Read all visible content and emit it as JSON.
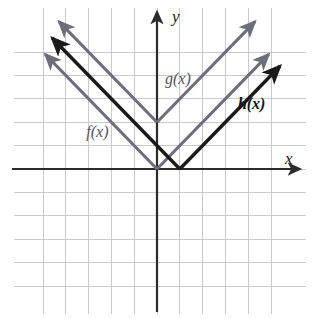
{
  "figure": {
    "type": "graph",
    "axis_labels": {
      "x": "x",
      "y": "y"
    },
    "curve_labels": {
      "f": "f(x)",
      "g": "g(x)",
      "h": "h(x)"
    }
  },
  "colors": {
    "grid": "#c9c9cf",
    "axis": "#2b2b2b",
    "gray_curve": "#6e6e78",
    "dark_curve": "#1a1a1a",
    "gray_label": "#55555f",
    "dark_label": "#141414",
    "background": "#ffffff"
  },
  "chart_data": {
    "type": "line",
    "title": "",
    "xlabel": "x",
    "ylabel": "y",
    "grid": true,
    "legend": "inline-annotations",
    "xlim": [
      -5,
      5
    ],
    "ylim": [
      -5,
      5
    ],
    "x_tick_step": 1,
    "y_tick_step": 1,
    "origin_px": {
      "x": 157,
      "y": 169
    },
    "unit_px": {
      "x": 22.8,
      "y": 23.4
    },
    "series": [
      {
        "name": "f(x)",
        "label": "f(x)",
        "equation": "f(x) = |x|",
        "shape": "v",
        "vertex": [
          0,
          0
        ],
        "slope_left": -1,
        "slope_right": 1,
        "color": "#6e6e78",
        "weight": "normal",
        "label_pos": [
          -3.1,
          1.35
        ],
        "points": [
          [
            -4.9,
            4.9
          ],
          [
            0,
            0
          ],
          [
            4.9,
            4.9
          ]
        ],
        "arrows": [
          "start",
          "end"
        ]
      },
      {
        "name": "g(x)",
        "label": "g(x)",
        "equation": "g(x) = |x| + 2",
        "shape": "v",
        "vertex": [
          0,
          2
        ],
        "slope_left": -1,
        "slope_right": 1,
        "color": "#6e6e78",
        "weight": "normal",
        "label_pos": [
          0.35,
          3.65
        ],
        "points": [
          [
            -4.3,
            6.3
          ],
          [
            0,
            2
          ],
          [
            4.3,
            6.3
          ]
        ],
        "arrows": [
          "start",
          "end"
        ]
      },
      {
        "name": "h(x)",
        "label": "h(x)",
        "equation": "h(x) = |x - 1|",
        "shape": "v",
        "vertex": [
          1,
          0
        ],
        "slope_left": -1,
        "slope_right": 1,
        "color": "#1a1a1a",
        "weight": "bold",
        "label_pos": [
          3.55,
          2.55
        ],
        "points": [
          [
            -4.6,
            5.6
          ],
          [
            1,
            0
          ],
          [
            5.4,
            4.4
          ]
        ],
        "arrows": [
          "start",
          "end"
        ]
      }
    ],
    "x_gridlines": [
      -5,
      -4,
      -3,
      -2,
      -1,
      0,
      1,
      2,
      3,
      4,
      5
    ],
    "y_gridlines": [
      -5,
      -4,
      -3,
      -2,
      -1,
      0,
      1,
      2,
      3,
      4,
      5
    ]
  }
}
